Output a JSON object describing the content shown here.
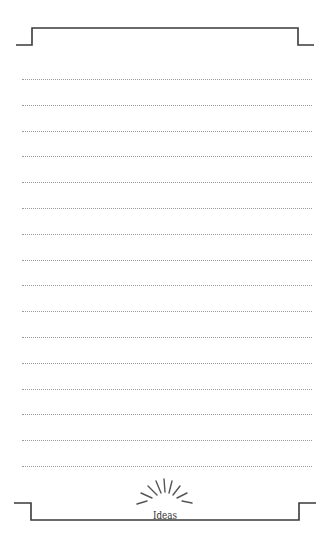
{
  "page": {
    "label": "Ideas",
    "line_count": 16,
    "line_start_y": 79,
    "line_spacing": 25.8,
    "colors": {
      "border": "#3a3a3a",
      "dotted_line": "#9a9a9a",
      "sunburst": "#555555"
    }
  }
}
